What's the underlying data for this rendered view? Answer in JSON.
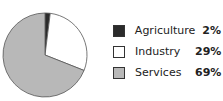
{
  "chart_data": {
    "type": "pie",
    "title": "",
    "categories": [
      "Agriculture",
      "Industry",
      "Services"
    ],
    "values": [
      2,
      29,
      69
    ],
    "value_labels": [
      "2%",
      "29%",
      "69%"
    ],
    "colors": [
      "#2b2b2b",
      "#ffffff",
      "#b8b8b8"
    ],
    "start_angle": "top",
    "direction": "clockwise",
    "legend_position": "right"
  },
  "legend": {
    "items": [
      {
        "label": "Agriculture",
        "value": "2%",
        "color": "#2b2b2b"
      },
      {
        "label": "Industry",
        "value": "29%",
        "color": "#ffffff"
      },
      {
        "label": "Services",
        "value": "69%",
        "color": "#b8b8b8"
      }
    ]
  }
}
